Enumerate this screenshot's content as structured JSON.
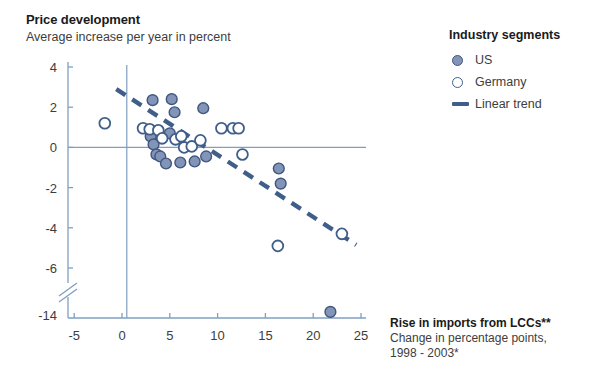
{
  "header": {
    "title": "Price development",
    "subtitle": "Average increase per year in percent"
  },
  "legend": {
    "title": "Industry segments",
    "items": [
      {
        "label": "US",
        "marker": "filled-circle-icon"
      },
      {
        "label": "Germany",
        "marker": "open-circle-icon"
      },
      {
        "label": "Linear trend",
        "marker": "dashed-line-icon"
      }
    ]
  },
  "axis_label": {
    "main": "Rise in imports from LCCs**",
    "line2": "Change in percentage points,",
    "line3": "1998 - 2003*"
  },
  "colors": {
    "us_fill": "#8294b8",
    "us_stroke": "#41567d",
    "germany_stroke": "#3f5f8a",
    "trend": "#3f5f8a",
    "axis": "#7f9fc0",
    "text": "#3d3d3d"
  },
  "chart_data": {
    "type": "scatter",
    "title": "Price development",
    "subtitle": "Average increase per year in percent",
    "xlabel": "Rise in imports from LCCs** — Change in percentage points, 1998 - 2003*",
    "ylabel": "Average increase per year in percent",
    "xlim": [
      -5,
      25
    ],
    "ylim": [
      -14,
      4
    ],
    "xticks": [
      -5,
      0,
      5,
      10,
      15,
      20,
      25
    ],
    "yticks": [
      4,
      2,
      0,
      -2,
      -4,
      -6,
      -14
    ],
    "y_axis_break_between": [
      -6,
      -14
    ],
    "grid": false,
    "legend_position": "top-right",
    "zero_line_y": 0,
    "zero_line_x": 0.5,
    "series": [
      {
        "name": "US",
        "marker": "filled-circle",
        "points": [
          [
            3.2,
            2.35
          ],
          [
            5.2,
            2.4
          ],
          [
            5.5,
            1.75
          ],
          [
            8.5,
            1.95
          ],
          [
            3.0,
            0.55
          ],
          [
            3.3,
            0.15
          ],
          [
            5.0,
            0.7
          ],
          [
            3.6,
            -0.35
          ],
          [
            4.0,
            -0.45
          ],
          [
            4.6,
            -0.8
          ],
          [
            6.1,
            -0.75
          ],
          [
            7.6,
            -0.7
          ],
          [
            8.8,
            -0.45
          ],
          [
            16.4,
            -1.05
          ],
          [
            16.6,
            -1.8
          ],
          [
            21.8,
            -13.0
          ]
        ]
      },
      {
        "name": "Germany",
        "marker": "open-circle",
        "points": [
          [
            -1.8,
            1.2
          ],
          [
            2.2,
            0.95
          ],
          [
            2.9,
            0.9
          ],
          [
            3.8,
            0.85
          ],
          [
            4.2,
            0.45
          ],
          [
            5.6,
            0.4
          ],
          [
            6.2,
            0.55
          ],
          [
            6.5,
            0.0
          ],
          [
            7.3,
            0.05
          ],
          [
            8.2,
            0.35
          ],
          [
            10.4,
            0.95
          ],
          [
            11.6,
            0.95
          ],
          [
            12.2,
            0.95
          ],
          [
            12.6,
            -0.35
          ],
          [
            16.3,
            -4.9
          ],
          [
            23.0,
            -4.3
          ]
        ]
      }
    ],
    "trend": {
      "name": "Linear trend",
      "style": "dashed",
      "x_start": -0.6,
      "y_start": 2.9,
      "x_end": 24.5,
      "y_end": -4.85
    }
  }
}
